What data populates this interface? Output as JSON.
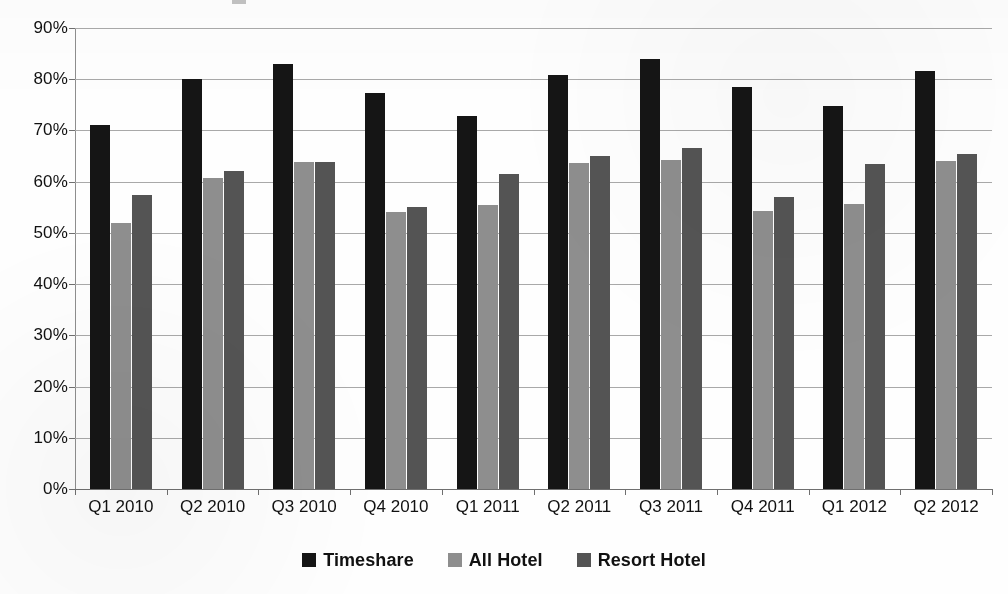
{
  "chart_data": {
    "type": "bar",
    "title": "",
    "subtitle": "",
    "xlabel": "",
    "ylabel": "",
    "ylim": [
      0,
      90
    ],
    "ytick_labels": [
      "0%",
      "10%",
      "20%",
      "30%",
      "40%",
      "50%",
      "60%",
      "70%",
      "80%",
      "90%"
    ],
    "ytick_values": [
      0,
      10,
      20,
      30,
      40,
      50,
      60,
      70,
      80,
      90
    ],
    "grid": true,
    "legend_position": "bottom",
    "categories": [
      "Q1 2010",
      "Q2 2010",
      "Q3 2010",
      "Q4 2010",
      "Q1 2011",
      "Q2 2011",
      "Q3 2011",
      "Q4 2011",
      "Q1 2012",
      "Q2 2012"
    ],
    "series": [
      {
        "name": "Timeshare",
        "color": "#151515",
        "values": [
          71.1,
          80.1,
          83.0,
          77.3,
          72.9,
          80.8,
          83.9,
          78.4,
          74.8,
          81.6
        ]
      },
      {
        "name": "All Hotel",
        "color": "#8e8e8e",
        "values": [
          52.0,
          60.7,
          63.9,
          54.0,
          55.5,
          63.7,
          64.3,
          54.2,
          55.6,
          64.0
        ]
      },
      {
        "name": "Resort Hotel",
        "color": "#545454",
        "values": [
          57.4,
          62.0,
          63.9,
          55.1,
          61.5,
          65.1,
          66.6,
          57.0,
          63.4,
          65.5
        ]
      }
    ]
  },
  "legend": {
    "items": [
      {
        "label": "Timeshare",
        "swatch": "black-square-icon"
      },
      {
        "label": "All Hotel",
        "swatch": "gray-square-icon"
      },
      {
        "label": "Resort Hotel",
        "swatch": "dark-gray-square-icon"
      }
    ]
  }
}
